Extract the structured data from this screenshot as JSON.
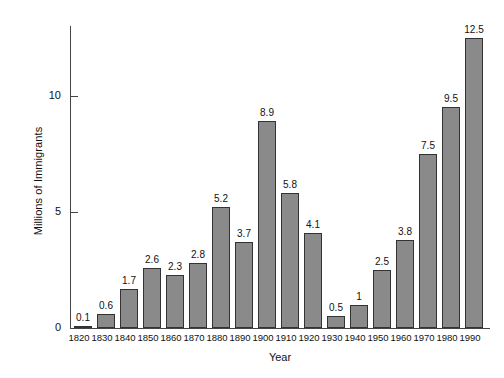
{
  "chart_data": {
    "type": "bar",
    "title": "",
    "xlabel": "Year",
    "ylabel": "Millions of Immigrants",
    "categories": [
      "1820",
      "1830",
      "1840",
      "1850",
      "1860",
      "1870",
      "1880",
      "1890",
      "1900",
      "1910",
      "1920",
      "1930",
      "1940",
      "1950",
      "1960",
      "1970",
      "1980",
      "1990"
    ],
    "values": [
      0.1,
      0.6,
      1.7,
      2.6,
      2.3,
      2.8,
      5.2,
      3.7,
      8.9,
      5.8,
      4.1,
      0.5,
      1,
      2.5,
      3.8,
      7.5,
      9.5,
      12.5
    ],
    "value_labels": [
      "0.1",
      "0.6",
      "1.7",
      "2.6",
      "2.3",
      "2.8",
      "5.2",
      "3.7",
      "8.9",
      "5.8",
      "4.1",
      "0.5",
      "1",
      "2.5",
      "3.8",
      "7.5",
      "9.5",
      "12.5"
    ],
    "ylim": [
      0,
      13
    ],
    "yticks": [
      0,
      5,
      10
    ],
    "ytick_labels": [
      "0",
      "5",
      "10"
    ],
    "grid": false,
    "legend": false,
    "bar_fill_color": "#8a8a8a",
    "bar_edge_color": "#333333",
    "axis_color": "#444444",
    "background_color": "#ffffff"
  }
}
